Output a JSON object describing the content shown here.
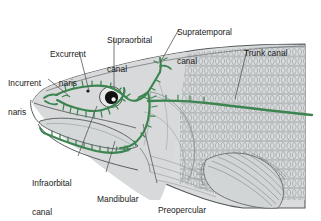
{
  "figure": {
    "colors": {
      "canal_green": "#3c8550",
      "body_fill": "#d8dadb",
      "outline": "#555a5c",
      "scale_line": "#8e9699",
      "text": "#1a1a1a",
      "leader_line": "#55595b",
      "background": "#ffffff"
    }
  },
  "labels": [
    {
      "id": "incurrent-naris",
      "text": "Incurrent\nnaris",
      "line1": "Incurrent",
      "line2": "naris",
      "x": 8,
      "y": 60
    },
    {
      "id": "excurrent-naris",
      "text": "Excurrent\nnaris",
      "line1": "Excurrent",
      "line2": "naris",
      "x": 50,
      "y": 31
    },
    {
      "id": "supraorbital-canal",
      "text": "Supraorbital\ncanal",
      "line1": "Supraorbital",
      "line2": "canal",
      "x": 107,
      "y": 17
    },
    {
      "id": "supratemporal-canal",
      "text": "Supratemporal\ncanal",
      "line1": "Supratemporal",
      "line2": "canal",
      "x": 177,
      "y": 9
    },
    {
      "id": "trunk-canal",
      "text": "Trunk canal",
      "line1": "Trunk canal",
      "line2": "",
      "x": 244,
      "y": 30
    },
    {
      "id": "infraorbital-canal",
      "text": "Infraorbital\ncanal",
      "line1": "Infraorbital",
      "line2": "canal",
      "x": 32,
      "y": 160
    },
    {
      "id": "mandibular-canal",
      "text": "Mandibular\ncanal",
      "line1": "Mandibular",
      "line2": "canal",
      "x": 97,
      "y": 176
    },
    {
      "id": "preopercular-canal",
      "text": "Preopercular\ncanal",
      "line1": "Preopercular",
      "line2": "canal",
      "x": 158,
      "y": 187
    }
  ],
  "leaders": [
    {
      "id": "leader-incurrent-naris",
      "from": [
        48,
        79
      ],
      "to": [
        68,
        95
      ]
    },
    {
      "id": "leader-excurrent-naris",
      "from": [
        79,
        51
      ],
      "to": [
        89,
        91
      ]
    },
    {
      "id": "leader-supraorbital-canal",
      "from": [
        114,
        37
      ],
      "to": [
        114,
        88
      ]
    },
    {
      "id": "leader-supratemporal-canal",
      "from": [
        178,
        29
      ],
      "to": [
        160,
        63
      ]
    },
    {
      "id": "leader-trunk-canal",
      "from": [
        246,
        50
      ],
      "to": [
        235,
        99
      ]
    },
    {
      "id": "leader-infraorbital-canal",
      "from": [
        78,
        156
      ],
      "to": [
        97,
        106
      ]
    },
    {
      "id": "leader-mandibular-canal",
      "from": [
        106,
        172
      ],
      "to": [
        115,
        141
      ]
    },
    {
      "id": "leader-preopercular-canal",
      "from": [
        157,
        183
      ],
      "to": [
        143,
        124
      ]
    }
  ],
  "anatomy": [
    {
      "id": "head-body",
      "name": "fish-head-outline"
    },
    {
      "id": "scale-field",
      "name": "scale-field"
    },
    {
      "id": "eye",
      "name": "eye"
    },
    {
      "id": "pupil",
      "name": "pupil"
    },
    {
      "id": "incurrent-naris-mark",
      "name": "incurrent-naris-opening"
    },
    {
      "id": "excurrent-naris-mark",
      "name": "excurrent-naris-opening"
    },
    {
      "id": "lower-jaw",
      "name": "lower-jaw"
    },
    {
      "id": "pectoral-fin",
      "name": "pectoral-fin"
    },
    {
      "id": "opercle",
      "name": "opercle"
    },
    {
      "id": "canal-supraorbital",
      "name": "supraorbital-canal-path"
    },
    {
      "id": "canal-infraorbital",
      "name": "infraorbital-canal-path"
    },
    {
      "id": "canal-supratemporal",
      "name": "supratemporal-canal-path"
    },
    {
      "id": "canal-preopercular",
      "name": "preopercular-canal-path"
    },
    {
      "id": "canal-mandibular",
      "name": "mandibular-canal-path"
    },
    {
      "id": "canal-trunk",
      "name": "trunk-canal-path"
    }
  ]
}
